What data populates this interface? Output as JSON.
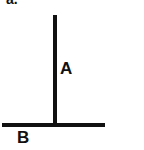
{
  "panel": {
    "label": "a."
  },
  "diagram": {
    "vertical_line": {
      "label": "A"
    },
    "horizontal_line": {
      "label": "B"
    },
    "line_color": "#111111"
  }
}
